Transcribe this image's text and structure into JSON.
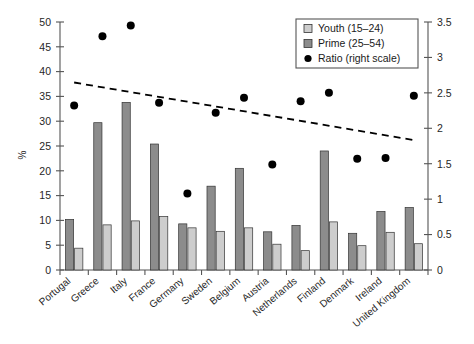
{
  "chart_data": {
    "type": "bar",
    "title": "",
    "subtitle": "",
    "xlabel": "",
    "ylabel": "%",
    "ylabel_right": "",
    "ylim": [
      0,
      50
    ],
    "ylim_right": [
      0,
      3.5
    ],
    "grid": false,
    "legend_position": "top-right",
    "categories": [
      "Portugal",
      "Greece",
      "Italy",
      "France",
      "Germany",
      "Sweden",
      "Belgium",
      "Austria",
      "Netherlands",
      "Finland",
      "Denmark",
      "Ireland",
      "United Kingdom"
    ],
    "y_ticks": [
      0,
      5,
      10,
      15,
      20,
      25,
      30,
      35,
      40,
      45,
      50
    ],
    "y_ticks_right": [
      0,
      0.5,
      1,
      1.5,
      2,
      2.5,
      3,
      3.5
    ],
    "series": [
      {
        "name": "Youth (15–24)",
        "axis": "left",
        "type": "bar",
        "color": "#8c8c8c",
        "values": [
          10.2,
          29.7,
          33.8,
          25.4,
          9.3,
          16.9,
          20.5,
          7.7,
          9.0,
          24.0,
          7.4,
          11.8,
          12.6
        ]
      },
      {
        "name": "Prime (25–54)",
        "axis": "left",
        "type": "bar",
        "color": "#cdcdcd",
        "values": [
          4.4,
          9.1,
          9.9,
          10.8,
          8.5,
          7.8,
          8.5,
          5.2,
          3.9,
          9.7,
          4.9,
          7.6,
          5.3
        ]
      },
      {
        "name": "Ratio (right scale)",
        "axis": "right",
        "type": "scatter",
        "color": "#000000",
        "values": [
          2.32,
          3.3,
          3.45,
          2.36,
          1.08,
          2.22,
          2.43,
          1.49,
          2.38,
          2.5,
          1.57,
          1.58,
          2.46
        ]
      }
    ],
    "trendline": {
      "name": "trend",
      "axis": "left",
      "style": "dashed",
      "x_start": 0,
      "x_end": 12,
      "y_start": 37.8,
      "y_end": 26.2
    }
  },
  "legend": {
    "items": [
      {
        "label": "Youth (15–24)",
        "marker": "square-light"
      },
      {
        "label": "Prime (25–54)",
        "marker": "square-dark"
      },
      {
        "label": "Ratio (right scale)",
        "marker": "circle-black"
      }
    ]
  },
  "axes": {
    "left_title": "%",
    "left_ticks": [
      "0",
      "5",
      "10",
      "15",
      "20",
      "25",
      "30",
      "35",
      "40",
      "45",
      "50"
    ],
    "right_ticks": [
      "0",
      "0.5",
      "1",
      "1.5",
      "2",
      "2.5",
      "3",
      "3.5"
    ]
  },
  "colors": {
    "youth_bar": "#8c8c8c",
    "prime_bar": "#cdcdcd",
    "dot": "#000000",
    "axis": "#555555",
    "text": "#262626",
    "background": "#ffffff"
  }
}
